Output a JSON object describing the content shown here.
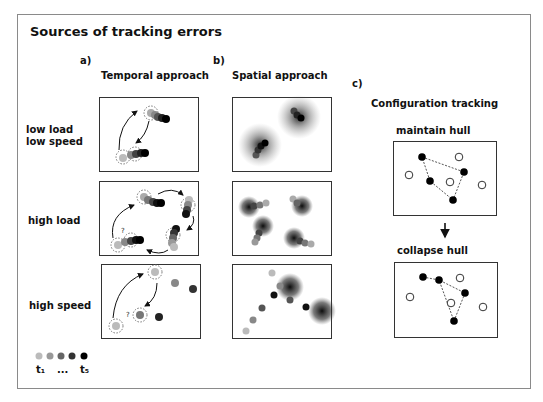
{
  "title": "Sources of tracking errors",
  "panels": {
    "a": {
      "letter": "a)",
      "heading": "Temporal approach"
    },
    "b": {
      "letter": "b)",
      "heading": "Spatial approach"
    },
    "c": {
      "letter": "c)",
      "heading": "Configuration tracking",
      "top_label": "maintain hull",
      "bottom_label": "collapse hull"
    }
  },
  "rows": [
    {
      "label_line1": "low load",
      "label_line2": "low speed"
    },
    {
      "label_line1": "high load"
    },
    {
      "label_line1": "high speed"
    }
  ],
  "legend": {
    "start": "t₁",
    "ellipsis": "...",
    "end": "t₅",
    "colors": [
      "#bbbbbb",
      "#999999",
      "#666666",
      "#333333",
      "#111111"
    ]
  },
  "question_mark": "?"
}
